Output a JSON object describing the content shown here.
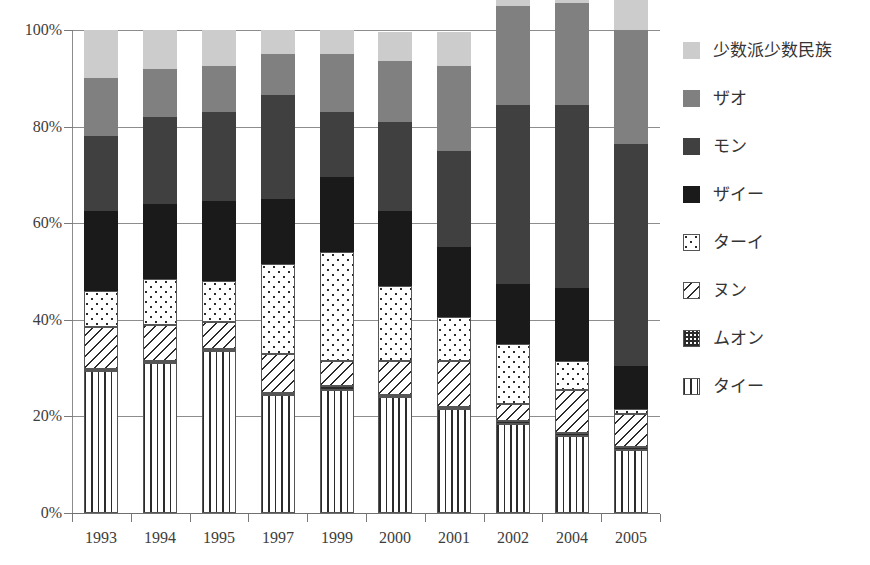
{
  "chart_data": {
    "type": "bar",
    "subtype": "stacked-percent",
    "title": "",
    "xlabel": "",
    "ylabel": "",
    "ylim": [
      0,
      100
    ],
    "grid": true,
    "legend_position": "right",
    "categories": [
      "1993",
      "1994",
      "1995",
      "1997",
      "1999",
      "2000",
      "2001",
      "2002",
      "2004",
      "2005"
    ],
    "ytick_labels": [
      "0%",
      "20%",
      "40%",
      "60%",
      "80%",
      "100%"
    ],
    "ytick_values": [
      0,
      20,
      40,
      60,
      80,
      100
    ],
    "series": [
      {
        "name": "タイー",
        "pattern": "vertical-stripes",
        "color": "#ffffff",
        "values": [
          29.5,
          31.0,
          33.5,
          24.5,
          25.5,
          24.0,
          21.5,
          18.5,
          16.0,
          13.0
        ]
      },
      {
        "name": "ムオン",
        "pattern": "checkerboard",
        "color": "#ffffff",
        "values": [
          0.4,
          0.4,
          0.4,
          0.4,
          0.8,
          0.4,
          0.4,
          0.6,
          0.6,
          0.6
        ]
      },
      {
        "name": "ヌン",
        "pattern": "diagonal-stripes",
        "color": "#ffffff",
        "values": [
          8.6,
          7.6,
          5.6,
          8.1,
          5.2,
          7.1,
          9.6,
          3.4,
          8.9,
          6.9
        ]
      },
      {
        "name": "ターイ",
        "pattern": "dots",
        "color": "#ffffff",
        "values": [
          7.5,
          9.5,
          8.5,
          18.5,
          22.5,
          15.5,
          9.0,
          12.5,
          6.0,
          1.0
        ]
      },
      {
        "name": "ザイー",
        "pattern": "solid",
        "color": "#1a1a1a",
        "values": [
          16.5,
          15.5,
          16.5,
          13.5,
          15.5,
          15.5,
          14.5,
          12.5,
          15.0,
          9.0
        ]
      },
      {
        "name": "モン",
        "pattern": "solid",
        "color": "#404040",
        "values": [
          15.5,
          18.0,
          18.5,
          21.5,
          13.5,
          18.5,
          20.0,
          37.0,
          38.0,
          46.0
        ]
      },
      {
        "name": "ザオ",
        "pattern": "solid",
        "color": "#808080",
        "values": [
          12.0,
          10.0,
          9.5,
          8.5,
          12.0,
          12.5,
          17.5,
          20.5,
          21.0,
          23.5
        ]
      },
      {
        "name": "少数派少数民族",
        "pattern": "solid",
        "color": "#cccccc",
        "values": [
          10.0,
          8.0,
          7.5,
          5.0,
          5.0,
          6.0,
          7.0,
          7.5,
          8.5,
          8.0
        ]
      }
    ]
  },
  "legend": {
    "items": [
      {
        "label": "少数派少数民族",
        "swatch": "light-gray-solid"
      },
      {
        "label": "ザオ",
        "swatch": "medium-gray-solid"
      },
      {
        "label": "モン",
        "swatch": "dark-gray-solid"
      },
      {
        "label": "ザイー",
        "swatch": "black-solid"
      },
      {
        "label": "ターイ",
        "swatch": "dots-pattern"
      },
      {
        "label": "ヌン",
        "swatch": "diagonal-pattern"
      },
      {
        "label": "ムオン",
        "swatch": "checker-pattern"
      },
      {
        "label": "タイー",
        "swatch": "vertical-pattern"
      }
    ]
  },
  "colors": {
    "light_gray": "#cccccc",
    "medium_gray": "#808080",
    "dark_gray": "#404040",
    "black": "#1a1a1a",
    "gridline": "#8d8d8d",
    "text": "#3a3a3a"
  }
}
